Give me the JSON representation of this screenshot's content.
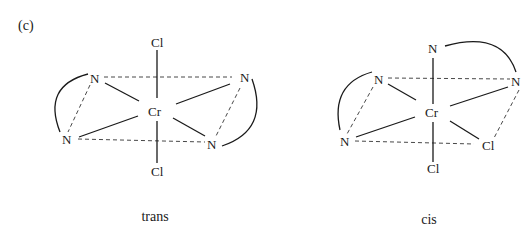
{
  "figure": {
    "panel_label": "(c)",
    "colors": {
      "ink": "#1a1a1a",
      "background": "#ffffff"
    }
  },
  "trans": {
    "caption": "trans",
    "center": "Cr",
    "axial_top": "Cl",
    "axial_bottom": "Cl",
    "n_upper_left": "N",
    "n_upper_right": "N",
    "n_lower_left": "N",
    "n_lower_right": "N"
  },
  "cis": {
    "caption": "cis",
    "center": "Cr",
    "axial_top": "N",
    "axial_bottom": "Cl",
    "n_upper_left": "N",
    "n_right": "N",
    "n_lower_left": "N",
    "cl_lower_right": "Cl"
  }
}
